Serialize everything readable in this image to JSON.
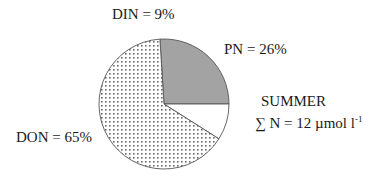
{
  "chart_data": {
    "type": "pie",
    "title": "SUMMER",
    "subtitle": "∑ N = 12 µmol l-1",
    "categories": [
      "PN",
      "DIN",
      "DON"
    ],
    "values": [
      26,
      9,
      65
    ],
    "unit": "%",
    "labels": [
      "PN = 26%",
      "DIN = 9%",
      "DON = 65%"
    ],
    "fills": {
      "PN": "#a3a3a3",
      "DIN": "#ffffff",
      "DON": "dotted pattern (#666666 dots on white)"
    },
    "start_angle_deg": -3.6,
    "direction": "clockwise",
    "legend": "none (direct labels)"
  },
  "labels": {
    "din": "DIN = 9%",
    "pn": "PN = 26%",
    "don": "DON = 65%",
    "season": "SUMMER",
    "total_prefix": "∑ N = 12 µmol l",
    "total_exp": "-1"
  },
  "colors": {
    "pn_fill": "#a3a3a3",
    "outline": "#555555",
    "dot": "#6b6b6b"
  }
}
